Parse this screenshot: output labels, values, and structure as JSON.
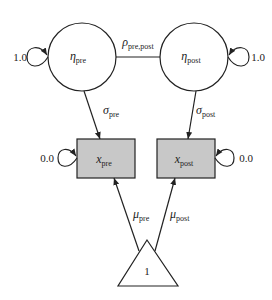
{
  "diagram": {
    "type": "path-diagram",
    "colors": {
      "stroke": "#222222",
      "observed_fill": "#c8c8c8",
      "latent_fill": "#ffffff"
    },
    "latent": [
      {
        "id": "eta_pre",
        "symbol": "η",
        "sub": "pre",
        "self_loop_label": "1.0"
      },
      {
        "id": "eta_post",
        "symbol": "η",
        "sub": "post",
        "self_loop_label": "1.0"
      }
    ],
    "observed": [
      {
        "id": "x_pre",
        "symbol": "x",
        "sub": "pre",
        "self_loop_label": "0.0"
      },
      {
        "id": "x_post",
        "symbol": "x",
        "sub": "post",
        "self_loop_label": "0.0"
      }
    ],
    "constant": {
      "id": "one",
      "label": "1"
    },
    "paths": {
      "covariance": {
        "symbol": "ρ",
        "sub": "pre,post"
      },
      "loading_pre": {
        "symbol": "σ",
        "sub": "pre"
      },
      "loading_post": {
        "symbol": "σ",
        "sub": "post"
      },
      "mean_pre": {
        "symbol": "μ",
        "sub": "pre"
      },
      "mean_post": {
        "symbol": "μ",
        "sub": "post"
      }
    }
  }
}
